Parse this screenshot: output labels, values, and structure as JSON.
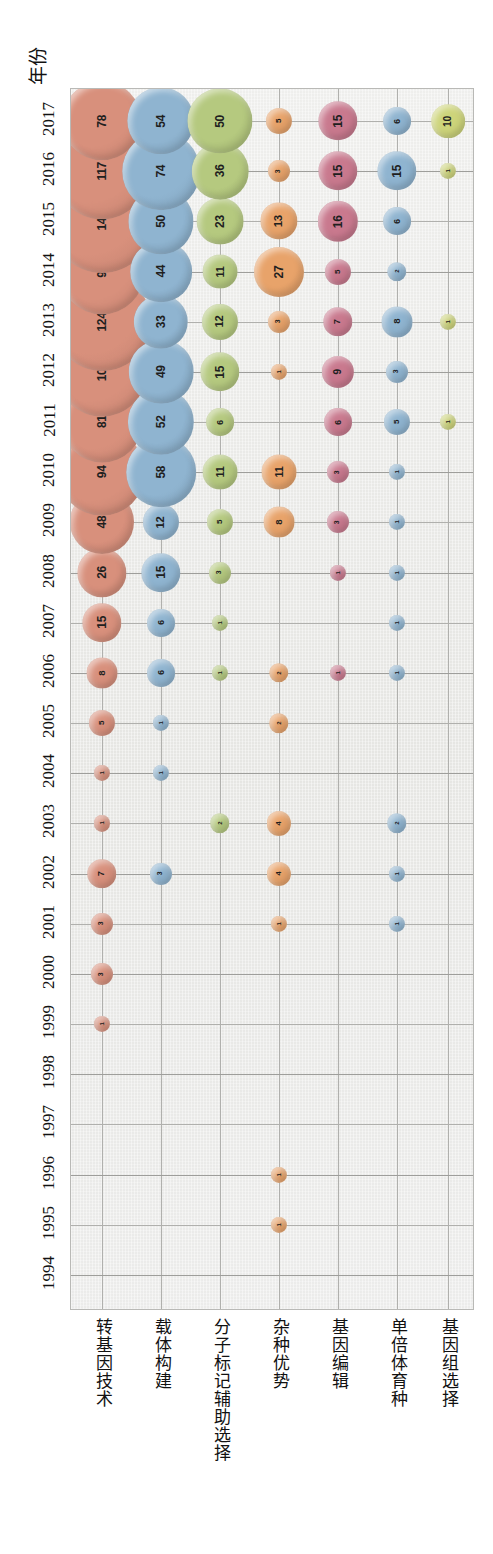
{
  "figure": {
    "axis_title_y": "年份",
    "background": "#e9e9e7",
    "panel_border": "#b9b9b6"
  },
  "chart_data": {
    "type": "bubble",
    "title": "",
    "xlabel": "",
    "ylabel": "年份",
    "orientation": "rotated-90",
    "grid": true,
    "legend": "none",
    "categories": [
      "转基因技术",
      "载体构建",
      "分子标记辅助选择",
      "杂种优势",
      "基因编辑",
      "单倍体育种",
      "基因组选择"
    ],
    "category_colors": [
      "#d8907c",
      "#8fb4d0",
      "#b5c97f",
      "#e8a36a",
      "#c9798e",
      "#8fb4d0",
      "#cdd47a"
    ],
    "years": [
      1994,
      1995,
      1996,
      1997,
      1998,
      1999,
      2000,
      2001,
      2002,
      2003,
      2004,
      2005,
      2006,
      2007,
      2008,
      2009,
      2010,
      2011,
      2012,
      2013,
      2014,
      2015,
      2016,
      2017
    ],
    "ylim": [
      1994,
      2017
    ],
    "series": [
      {
        "name": "转基因技术",
        "color": "#d8907c",
        "points": [
          {
            "year": 1999,
            "value": 1
          },
          {
            "year": 2000,
            "value": 3
          },
          {
            "year": 2001,
            "value": 3
          },
          {
            "year": 2002,
            "value": 7
          },
          {
            "year": 2003,
            "value": 1
          },
          {
            "year": 2004,
            "value": 1
          },
          {
            "year": 2005,
            "value": 5
          },
          {
            "year": 2006,
            "value": 8
          },
          {
            "year": 2007,
            "value": 15
          },
          {
            "year": 2008,
            "value": 26
          },
          {
            "year": 2009,
            "value": 48
          },
          {
            "year": 2010,
            "value": 94
          },
          {
            "year": 2011,
            "value": 81
          },
          {
            "year": 2012,
            "value": 104
          },
          {
            "year": 2013,
            "value": 124
          },
          {
            "year": 2014,
            "value": 91
          },
          {
            "year": 2015,
            "value": 141
          },
          {
            "year": 2016,
            "value": 117
          },
          {
            "year": 2017,
            "value": 78
          }
        ]
      },
      {
        "name": "载体构建",
        "color": "#8fb4d0",
        "points": [
          {
            "year": 2002,
            "value": 3
          },
          {
            "year": 2004,
            "value": 1
          },
          {
            "year": 2005,
            "value": 1
          },
          {
            "year": 2006,
            "value": 6
          },
          {
            "year": 2007,
            "value": 6
          },
          {
            "year": 2008,
            "value": 15
          },
          {
            "year": 2009,
            "value": 12
          },
          {
            "year": 2010,
            "value": 58
          },
          {
            "year": 2011,
            "value": 52
          },
          {
            "year": 2012,
            "value": 49
          },
          {
            "year": 2013,
            "value": 33
          },
          {
            "year": 2014,
            "value": 44
          },
          {
            "year": 2015,
            "value": 50
          },
          {
            "year": 2016,
            "value": 74
          },
          {
            "year": 2017,
            "value": 54
          }
        ]
      },
      {
        "name": "分子标记辅助选择",
        "color": "#b5c97f",
        "points": [
          {
            "year": 2003,
            "value": 2
          },
          {
            "year": 2006,
            "value": 1
          },
          {
            "year": 2007,
            "value": 1
          },
          {
            "year": 2008,
            "value": 3
          },
          {
            "year": 2009,
            "value": 5
          },
          {
            "year": 2010,
            "value": 11
          },
          {
            "year": 2011,
            "value": 6
          },
          {
            "year": 2012,
            "value": 15
          },
          {
            "year": 2013,
            "value": 12
          },
          {
            "year": 2014,
            "value": 11
          },
          {
            "year": 2015,
            "value": 23
          },
          {
            "year": 2016,
            "value": 36
          },
          {
            "year": 2017,
            "value": 50
          }
        ]
      },
      {
        "name": "杂种优势",
        "color": "#e8a36a",
        "points": [
          {
            "year": 1995,
            "value": 1
          },
          {
            "year": 1996,
            "value": 1
          },
          {
            "year": 2001,
            "value": 1
          },
          {
            "year": 2002,
            "value": 4
          },
          {
            "year": 2003,
            "value": 4
          },
          {
            "year": 2005,
            "value": 2
          },
          {
            "year": 2006,
            "value": 2
          },
          {
            "year": 2009,
            "value": 8
          },
          {
            "year": 2010,
            "value": 11
          },
          {
            "year": 2012,
            "value": 1
          },
          {
            "year": 2013,
            "value": 3
          },
          {
            "year": 2014,
            "value": 27
          },
          {
            "year": 2015,
            "value": 13
          },
          {
            "year": 2016,
            "value": 3
          },
          {
            "year": 2017,
            "value": 5
          }
        ]
      },
      {
        "name": "基因编辑",
        "color": "#c9798e",
        "points": [
          {
            "year": 2006,
            "value": 1
          },
          {
            "year": 2008,
            "value": 1
          },
          {
            "year": 2009,
            "value": 3
          },
          {
            "year": 2010,
            "value": 3
          },
          {
            "year": 2011,
            "value": 6
          },
          {
            "year": 2012,
            "value": 9
          },
          {
            "year": 2013,
            "value": 7
          },
          {
            "year": 2014,
            "value": 5
          },
          {
            "year": 2015,
            "value": 16
          },
          {
            "year": 2016,
            "value": 15
          },
          {
            "year": 2017,
            "value": 15
          }
        ]
      },
      {
        "name": "单倍体育种",
        "color": "#8fb4d0",
        "points": [
          {
            "year": 2001,
            "value": 1
          },
          {
            "year": 2002,
            "value": 1
          },
          {
            "year": 2003,
            "value": 2
          },
          {
            "year": 2006,
            "value": 1
          },
          {
            "year": 2007,
            "value": 1
          },
          {
            "year": 2008,
            "value": 1
          },
          {
            "year": 2009,
            "value": 1
          },
          {
            "year": 2010,
            "value": 1
          },
          {
            "year": 2011,
            "value": 5
          },
          {
            "year": 2012,
            "value": 3
          },
          {
            "year": 2013,
            "value": 8
          },
          {
            "year": 2014,
            "value": 2
          },
          {
            "year": 2015,
            "value": 6
          },
          {
            "year": 2016,
            "value": 15
          },
          {
            "year": 2017,
            "value": 6
          }
        ]
      },
      {
        "name": "基因组选择",
        "color": "#cdd47a",
        "points": [
          {
            "year": 2011,
            "value": 1
          },
          {
            "year": 2013,
            "value": 1
          },
          {
            "year": 2016,
            "value": 1
          },
          {
            "year": 2017,
            "value": 10
          }
        ]
      }
    ]
  }
}
